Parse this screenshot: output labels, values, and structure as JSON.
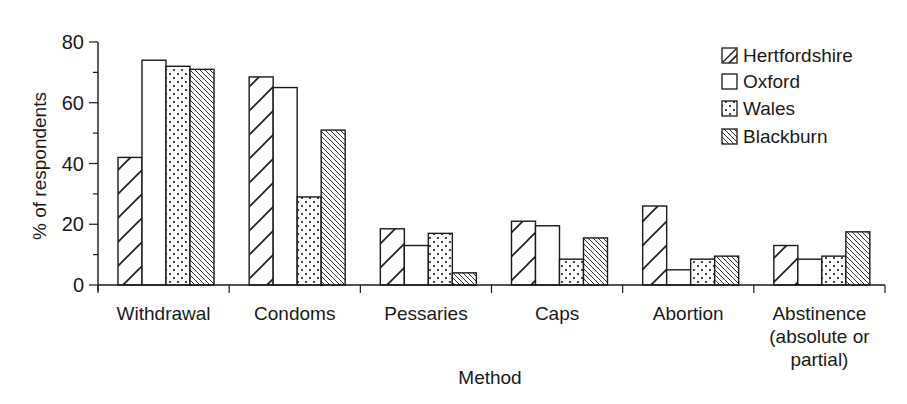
{
  "chart_data": {
    "type": "bar",
    "title": "",
    "xlabel": "Method",
    "ylabel": "% of respondents",
    "ylim": [
      0,
      80
    ],
    "yticks": [
      0,
      20,
      40,
      60,
      80
    ],
    "grid": false,
    "legend_position": "top-right",
    "categories": [
      "Withdrawal",
      "Condoms",
      "Pessaries",
      "Caps",
      "Abortion",
      "Abstinence (absolute or partial)"
    ],
    "category_label_lines": [
      [
        "Withdrawal"
      ],
      [
        "Condoms"
      ],
      [
        "Pessaries"
      ],
      [
        "Caps"
      ],
      [
        "Abortion"
      ],
      [
        "Abstinence",
        "(absolute or",
        "partial)"
      ]
    ],
    "series": [
      {
        "name": "Hertfordshire",
        "pattern": "wide-forward-hatch",
        "values": [
          42,
          68.5,
          18.5,
          21,
          26,
          13
        ]
      },
      {
        "name": "Oxford",
        "pattern": "blank",
        "values": [
          74,
          65,
          13,
          19.5,
          5,
          8.5
        ]
      },
      {
        "name": "Wales",
        "pattern": "dots",
        "values": [
          72,
          29,
          17,
          8.5,
          8.5,
          9.5
        ]
      },
      {
        "name": "Blackburn",
        "pattern": "fine-back-hatch",
        "values": [
          71,
          51,
          4,
          15.5,
          9.5,
          17.5
        ]
      }
    ]
  }
}
